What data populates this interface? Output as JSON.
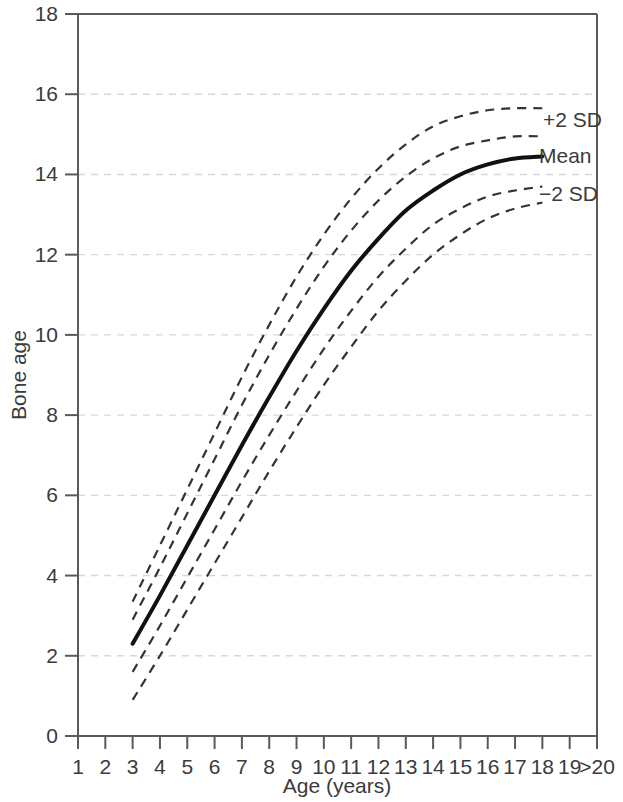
{
  "chart_data": {
    "type": "line",
    "title": "",
    "xlabel": "Age (years)",
    "ylabel": "Bone age",
    "xlim": [
      1,
      20
    ],
    "ylim": [
      0,
      18
    ],
    "grid": "horizontal-dashed",
    "legend": "inline-right",
    "x_tick_labels": [
      "1",
      "2",
      "3",
      "4",
      "5",
      "6",
      "7",
      "8",
      "9",
      "10",
      "11",
      "12",
      "13",
      "14",
      "15",
      "16",
      "17",
      "18",
      "19",
      ">20"
    ],
    "y_tick_labels": [
      "0",
      "2",
      "4",
      "6",
      "8",
      "10",
      "12",
      "14",
      "16",
      "18"
    ],
    "y_ticks": [
      0,
      2,
      4,
      6,
      8,
      10,
      12,
      14,
      16,
      18
    ],
    "x": [
      3,
      4,
      5,
      6,
      7,
      8,
      9,
      10,
      11,
      12,
      13,
      14,
      15,
      16,
      17,
      18
    ],
    "series": [
      {
        "name": "+2 SD outer",
        "style": "dashed",
        "label": "",
        "values": [
          3.35,
          4.75,
          6.15,
          7.55,
          8.95,
          10.25,
          11.45,
          12.5,
          13.4,
          14.15,
          14.75,
          15.2,
          15.45,
          15.6,
          15.65,
          15.65
        ]
      },
      {
        "name": "+2 SD",
        "style": "dashed",
        "label": "+2 SD",
        "values": [
          2.9,
          4.2,
          5.55,
          6.9,
          8.25,
          9.5,
          10.65,
          11.7,
          12.6,
          13.35,
          13.95,
          14.4,
          14.7,
          14.85,
          14.95,
          14.95
        ]
      },
      {
        "name": "Mean",
        "style": "solid",
        "label": "Mean",
        "values": [
          2.3,
          3.5,
          4.75,
          6.0,
          7.25,
          8.45,
          9.6,
          10.65,
          11.6,
          12.4,
          13.1,
          13.6,
          14.0,
          14.25,
          14.4,
          14.45
        ]
      },
      {
        "name": "-2 SD",
        "style": "dashed",
        "label": "−2 SD",
        "values": [
          1.6,
          2.75,
          3.95,
          5.15,
          6.35,
          7.5,
          8.6,
          9.65,
          10.6,
          11.45,
          12.15,
          12.75,
          13.15,
          13.45,
          13.6,
          13.7
        ]
      },
      {
        "name": "-2 SD outer",
        "style": "dashed",
        "label": "",
        "values": [
          0.9,
          2.0,
          3.15,
          4.3,
          5.45,
          6.6,
          7.7,
          8.75,
          9.7,
          10.6,
          11.35,
          12.0,
          12.5,
          12.9,
          13.15,
          13.3
        ]
      }
    ],
    "colors": {
      "mean_line": "#111111",
      "sd_line": "#333333",
      "grid": "#d8d8dc",
      "axis": "#5a5a5a",
      "text": "#3b3b3b",
      "background": "#ffffff"
    }
  },
  "labels": {
    "plus2sd": "+2 SD",
    "mean": "Mean",
    "minus2sd": "−2 SD",
    "x_axis_title": "Age (years)",
    "y_axis_title": "Bone age"
  }
}
